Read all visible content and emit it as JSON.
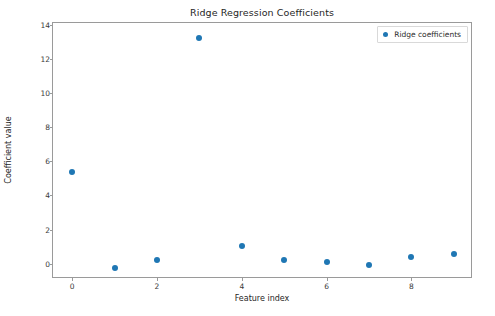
{
  "chart_data": {
    "type": "scatter",
    "title": "Ridge Regression Coefficients",
    "xlabel": "Feature index",
    "ylabel": "Coefficient value",
    "x": [
      0,
      1,
      2,
      3,
      4,
      5,
      6,
      7,
      8,
      9
    ],
    "values": [
      5.35,
      -0.23,
      0.23,
      13.25,
      1.05,
      0.2,
      0.1,
      -0.1,
      0.4,
      0.58
    ],
    "series": [
      {
        "name": "Ridge coefficients",
        "marker": "o",
        "color": "#1f77b4",
        "values": [
          5.35,
          -0.23,
          0.23,
          13.25,
          1.05,
          0.2,
          0.1,
          -0.1,
          0.4,
          0.58
        ]
      }
    ],
    "xticks": [
      0,
      2,
      4,
      6,
      8
    ],
    "xtick_labels": [
      "0",
      "2",
      "4",
      "6",
      "8"
    ],
    "yticks": [
      0,
      2,
      4,
      6,
      8,
      10,
      12,
      14
    ],
    "ytick_labels": [
      "0",
      "2",
      "4",
      "6",
      "8",
      "10",
      "12",
      "14"
    ],
    "xlim": [
      -0.45,
      9.45
    ],
    "ylim": [
      -0.9,
      14.1
    ],
    "grid": false,
    "legend": {
      "entries": [
        "Ridge coefficients"
      ],
      "position": "upper right"
    }
  },
  "colors": {
    "marker": "#1f77b4",
    "axis": "#9a9a9a",
    "text": "#262626",
    "background": "#ffffff"
  }
}
